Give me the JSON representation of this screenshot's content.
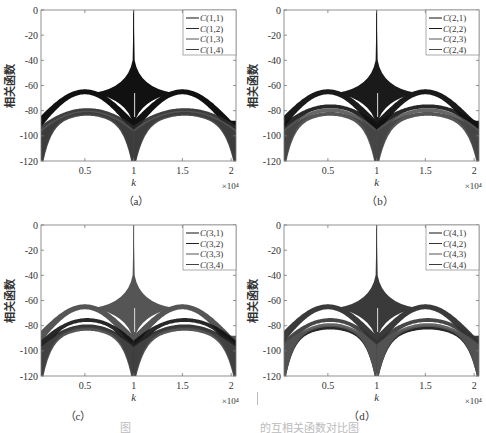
{
  "figure": {
    "caption_fragments": [
      {
        "text": "图",
        "x": 120
      },
      {
        "text": "的互相关函数对比图",
        "x": 260
      }
    ]
  },
  "chart_data": [
    {
      "type": "line",
      "panel_label": "（a）",
      "title": "",
      "xlabel": "k",
      "ylabel": "相关函数",
      "x_multiplier": "×10⁴",
      "xlim": [
        0.05,
        2.05
      ],
      "ylim": [
        -120,
        0
      ],
      "xticks": [
        0.5,
        1,
        1.5,
        2
      ],
      "xtick_labels": [
        "0.5",
        "1",
        "1.5",
        "2"
      ],
      "yticks": [
        0,
        -20,
        -40,
        -60,
        -80,
        -100,
        -120
      ],
      "ytick_labels": [
        "0",
        "-20",
        "-40",
        "-60",
        "-80",
        "-100",
        "-120"
      ],
      "grid": false,
      "legend_position": "upper right",
      "legend": [
        "C(1,1)",
        "C(1,2)",
        "C(1,3)",
        "C(1,4)"
      ],
      "series": [
        {
          "name": "C(1,1)",
          "role": "auto",
          "color": "#111111",
          "peak": 0,
          "envelope_top": -63,
          "envelope_bottom": -88,
          "edge": -88
        },
        {
          "name": "C(1,2)",
          "role": "cross",
          "color": "#2a2a2a",
          "peak": -78,
          "envelope_top": -78,
          "envelope_bottom": -120,
          "edge": -92
        },
        {
          "name": "C(1,3)",
          "role": "cross",
          "color": "#555555",
          "peak": -80,
          "envelope_top": -80,
          "envelope_bottom": -120,
          "edge": -95
        },
        {
          "name": "C(1,4)",
          "role": "cross",
          "color": "#3a3a3a",
          "peak": -81,
          "envelope_top": -81,
          "envelope_bottom": -120,
          "edge": -97
        }
      ]
    },
    {
      "type": "line",
      "panel_label": "（b）",
      "title": "",
      "xlabel": "k",
      "ylabel": "相关函数",
      "x_multiplier": "×10⁴",
      "xlim": [
        0.05,
        2.05
      ],
      "ylim": [
        -120,
        0
      ],
      "xticks": [
        0.5,
        1,
        1.5,
        2
      ],
      "xtick_labels": [
        "0.5",
        "1",
        "1.5",
        "2"
      ],
      "yticks": [
        0,
        -20,
        -40,
        -60,
        -80,
        -100,
        -120
      ],
      "ytick_labels": [
        "0",
        "-20",
        "-40",
        "-60",
        "-80",
        "-100",
        "-120"
      ],
      "grid": false,
      "legend_position": "upper right",
      "legend": [
        "C(2,1)",
        "C(2,2)",
        "C(2,3)",
        "C(2,4)"
      ],
      "series": [
        {
          "name": "C(2,1)",
          "role": "cross",
          "color": "#111111",
          "peak": -75,
          "envelope_top": -75,
          "envelope_bottom": -90,
          "edge": -90
        },
        {
          "name": "C(2,2)",
          "role": "auto",
          "color": "#1a1a1a",
          "peak": 0,
          "envelope_top": -63,
          "envelope_bottom": -88,
          "edge": -88
        },
        {
          "name": "C(2,3)",
          "role": "cross",
          "color": "#555555",
          "peak": -78,
          "envelope_top": -78,
          "envelope_bottom": -120,
          "edge": -95
        },
        {
          "name": "C(2,4)",
          "role": "cross",
          "color": "#444444",
          "peak": -81,
          "envelope_top": -81,
          "envelope_bottom": -120,
          "edge": -97
        }
      ]
    },
    {
      "type": "line",
      "panel_label": "（c）",
      "title": "",
      "xlabel": "k",
      "ylabel": "相关函数",
      "x_multiplier": "×10⁴",
      "xlim": [
        0.05,
        2.05
      ],
      "ylim": [
        -120,
        0
      ],
      "xticks": [
        0.5,
        1,
        1.5,
        2
      ],
      "xtick_labels": [
        "0.5",
        "1",
        "1.5",
        "2"
      ],
      "yticks": [
        0,
        -20,
        -40,
        -60,
        -80,
        -100,
        -120
      ],
      "ytick_labels": [
        "0",
        "-20",
        "-40",
        "-60",
        "-80",
        "-100",
        "-120"
      ],
      "grid": false,
      "legend_position": "upper right",
      "legend": [
        "C(3,1)",
        "C(3,2)",
        "C(3,3)",
        "C(3,4)"
      ],
      "series": [
        {
          "name": "C(3,1)",
          "role": "cross",
          "color": "#111111",
          "peak": -74,
          "envelope_top": -74,
          "envelope_bottom": -120,
          "edge": -92
        },
        {
          "name": "C(3,2)",
          "role": "cross",
          "color": "#222222",
          "peak": -79,
          "envelope_top": -79,
          "envelope_bottom": -120,
          "edge": -95
        },
        {
          "name": "C(3,3)",
          "role": "auto",
          "color": "#555555",
          "peak": 0,
          "envelope_top": -63,
          "envelope_bottom": -88,
          "edge": -88
        },
        {
          "name": "C(3,4)",
          "role": "cross",
          "color": "#444444",
          "peak": -81,
          "envelope_top": -81,
          "envelope_bottom": -120,
          "edge": -97
        }
      ]
    },
    {
      "type": "line",
      "panel_label": "（d）",
      "title": "",
      "xlabel": "k",
      "ylabel": "相关函数",
      "x_multiplier": "×10⁴",
      "xlim": [
        0.05,
        2.05
      ],
      "ylim": [
        -120,
        0
      ],
      "xticks": [
        0.5,
        1,
        1.5,
        2
      ],
      "xtick_labels": [
        "0.5",
        "1",
        "1.5",
        "2"
      ],
      "yticks": [
        0,
        -20,
        -40,
        -60,
        -80,
        -100,
        -120
      ],
      "ytick_labels": [
        "0",
        "-20",
        "-40",
        "-60",
        "-80",
        "-100",
        "-120"
      ],
      "grid": false,
      "legend_position": "upper right",
      "legend": [
        "C(4,1)",
        "C(4,2)",
        "C(4,3)",
        "C(4,4)"
      ],
      "series": [
        {
          "name": "C(4,1)",
          "role": "cross",
          "color": "#111111",
          "peak": -80,
          "envelope_top": -80,
          "envelope_bottom": -120,
          "edge": -95
        },
        {
          "name": "C(4,2)",
          "role": "cross",
          "color": "#333333",
          "peak": -74,
          "envelope_top": -74,
          "envelope_bottom": -120,
          "edge": -92
        },
        {
          "name": "C(4,3)",
          "role": "cross",
          "color": "#555555",
          "peak": -78,
          "envelope_top": -78,
          "envelope_bottom": -120,
          "edge": -95
        },
        {
          "name": "C(4,4)",
          "role": "auto",
          "color": "#3a3a3a",
          "peak": 0,
          "envelope_top": -63,
          "envelope_bottom": -88,
          "edge": -88
        }
      ]
    }
  ]
}
